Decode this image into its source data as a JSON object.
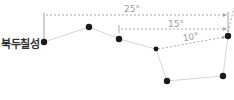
{
  "title": "북두칠성",
  "colors": {
    "star": "#1a1a1a",
    "line": "#d6d6d6",
    "dashed": "#a9a9a9",
    "label": "#9a9a9a",
    "title": "#333333"
  },
  "stars": [
    {
      "x": 44,
      "y": 42
    },
    {
      "x": 89,
      "y": 27
    },
    {
      "x": 119,
      "y": 39
    },
    {
      "x": 156,
      "y": 49
    },
    {
      "x": 167,
      "y": 81
    },
    {
      "x": 223,
      "y": 76
    },
    {
      "x": 228,
      "y": 36
    }
  ],
  "measurements": [
    {
      "label": "25°"
    },
    {
      "label": "15°"
    },
    {
      "label": "10°"
    }
  ]
}
